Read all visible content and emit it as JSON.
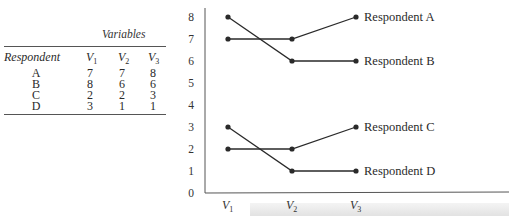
{
  "table": {
    "group_header": "Variables",
    "columns": [
      "Respondent",
      "V1",
      "V2",
      "V3"
    ],
    "column_subscripts": [
      "",
      "1",
      "2",
      "3"
    ],
    "rows": [
      {
        "respondent": "A",
        "v1": "7",
        "v2": "7",
        "v3": "8"
      },
      {
        "respondent": "B",
        "v1": "8",
        "v2": "6",
        "v3": "6"
      },
      {
        "respondent": "C",
        "v1": "2",
        "v2": "2",
        "v3": "3"
      },
      {
        "respondent": "D",
        "v1": "3",
        "v2": "1",
        "v3": "1"
      }
    ]
  },
  "chart_data": {
    "type": "line",
    "title": "",
    "xlabel": "",
    "ylabel": "",
    "categories": [
      "V1",
      "V2",
      "V3"
    ],
    "series": [
      {
        "name": "Respondent A",
        "values": [
          7,
          7,
          8
        ]
      },
      {
        "name": "Respondent B",
        "values": [
          8,
          6,
          6
        ]
      },
      {
        "name": "Respondent C",
        "values": [
          2,
          2,
          3
        ]
      },
      {
        "name": "Respondent D",
        "values": [
          3,
          1,
          1
        ]
      }
    ],
    "yticks": [
      0,
      1,
      2,
      3,
      4,
      5,
      6,
      7,
      8
    ],
    "ylim": [
      0,
      8
    ],
    "grid": false,
    "legend": "direct labels at line ends"
  },
  "colors": {
    "line": "#2a2a2a",
    "axis": "#555555"
  }
}
